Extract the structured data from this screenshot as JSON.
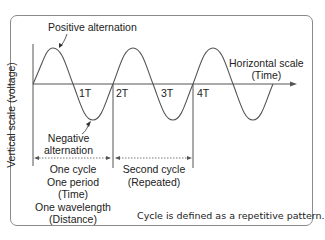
{
  "diagram": {
    "title_labels": {
      "positive": "Positive alternation",
      "negative_line1": "Negative",
      "negative_line2": "alternation",
      "horizontal_line1": "Horizontal scale",
      "horizontal_line2": "(Time)",
      "vertical": "Vertical scale (voltage)"
    },
    "ticks": [
      "1T",
      "2T",
      "3T",
      "4T"
    ],
    "first_cycle": [
      "One cycle",
      "One period",
      "(Time)",
      "One wavelength",
      "(Distance)"
    ],
    "second_cycle": [
      "Second cycle",
      "(Repeated)"
    ],
    "note": "Cycle is defined as a repetitive pattern.",
    "colors": {
      "line": "#555555",
      "border": "#8a8a8a",
      "text": "#222222"
    }
  }
}
